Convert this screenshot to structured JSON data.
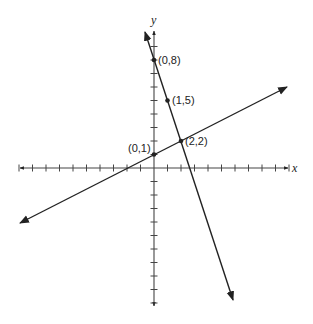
{
  "graph": {
    "axes": {
      "x_label": "x",
      "y_label": "y",
      "origin_px": [
        154,
        168
      ],
      "unit_px": 13.5,
      "x_ticks": [
        -10,
        -9,
        -8,
        -7,
        -6,
        -5,
        -4,
        -3,
        -2,
        -1,
        1,
        2,
        3,
        4,
        5,
        6,
        7,
        8,
        9,
        10
      ],
      "y_ticks": [
        -10,
        -9,
        -8,
        -7,
        -6,
        -5,
        -4,
        -3,
        -2,
        -1,
        1,
        2,
        3,
        4,
        5,
        6,
        7,
        8,
        9
      ]
    },
    "lines": [
      {
        "name": "steep-line",
        "equation": "y = -3x + 8",
        "slope": -3,
        "intercept": 8,
        "x_range": [
          -0.7,
          5.85
        ]
      },
      {
        "name": "shallow-line",
        "equation": "y = 0.5x + 1",
        "slope": 0.5,
        "intercept": 1,
        "x_range": [
          -9.9,
          9.85
        ]
      }
    ],
    "points": [
      {
        "label": "(0,8)",
        "x": 0,
        "y": 8
      },
      {
        "label": "(1,5)",
        "x": 1,
        "y": 5
      },
      {
        "label": "(0,1)",
        "x": 0,
        "y": 1
      },
      {
        "label": "(2,2)",
        "x": 2,
        "y": 2
      }
    ],
    "colors": {
      "stroke": "#222222",
      "background": "#ffffff"
    }
  }
}
